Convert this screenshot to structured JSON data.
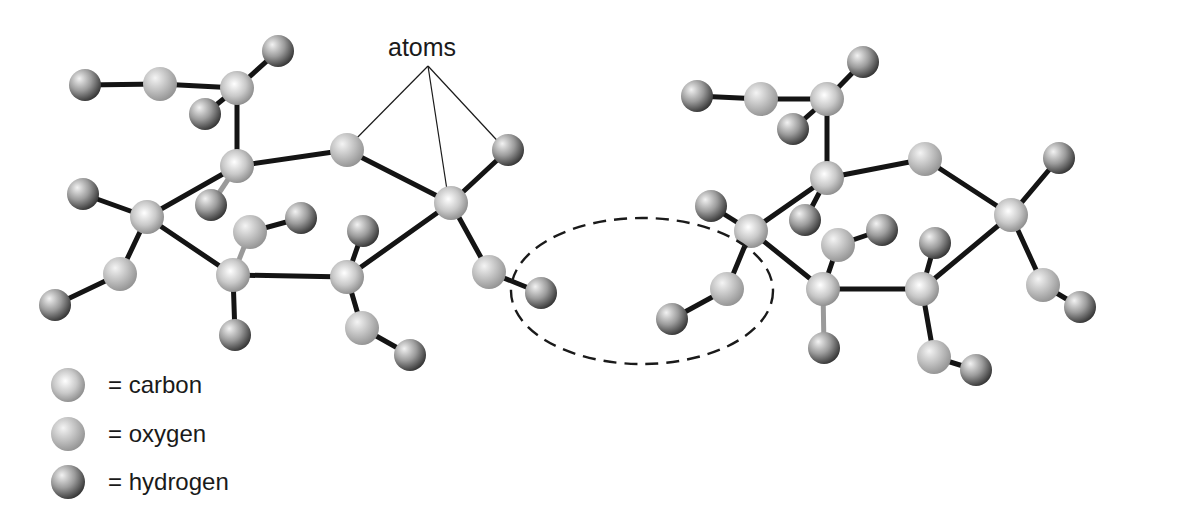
{
  "annotation": {
    "label": "atoms"
  },
  "legend": [
    {
      "key": "carbon",
      "label": "= carbon"
    },
    {
      "key": "oxygen",
      "label": "= oxygen"
    },
    {
      "key": "hydrogen",
      "label": "= hydrogen"
    }
  ],
  "colors": {
    "carbon": {
      "hi": "#ffffff",
      "mid": "#c9c9c9",
      "lo": "#8a8a8a"
    },
    "oxygen": {
      "hi": "#f4f4f4",
      "mid": "#bdbdbd",
      "lo": "#8f8f8f"
    },
    "hydrogen": {
      "hi": "#f2f2f2",
      "mid": "#9c9c9c",
      "lo": "#2e2e2e"
    },
    "bond": "#141414"
  },
  "molecules": [
    {
      "name": "left-sugar",
      "atoms": [
        {
          "id": "a1",
          "type": "hydrogen"
        },
        {
          "id": "a2",
          "type": "oxygen"
        },
        {
          "id": "a3",
          "type": "carbon"
        },
        {
          "id": "a4",
          "type": "hydrogen"
        },
        {
          "id": "a5",
          "type": "hydrogen"
        },
        {
          "id": "a6",
          "type": "carbon"
        },
        {
          "id": "a7",
          "type": "hydrogen"
        },
        {
          "id": "a8",
          "type": "oxygen"
        },
        {
          "id": "a9",
          "type": "carbon"
        },
        {
          "id": "a10",
          "type": "hydrogen"
        },
        {
          "id": "a11",
          "type": "hydrogen"
        },
        {
          "id": "a12",
          "type": "carbon"
        },
        {
          "id": "a13",
          "type": "oxygen"
        },
        {
          "id": "a14",
          "type": "hydrogen"
        },
        {
          "id": "a15",
          "type": "carbon"
        },
        {
          "id": "a16",
          "type": "oxygen"
        },
        {
          "id": "a17",
          "type": "hydrogen"
        },
        {
          "id": "a18",
          "type": "hydrogen"
        },
        {
          "id": "a19",
          "type": "carbon"
        },
        {
          "id": "a20",
          "type": "hydrogen"
        },
        {
          "id": "a21",
          "type": "oxygen"
        },
        {
          "id": "a22",
          "type": "hydrogen"
        },
        {
          "id": "a23",
          "type": "oxygen"
        },
        {
          "id": "a24",
          "type": "hydrogen"
        }
      ]
    },
    {
      "name": "right-sugar",
      "atoms": [
        {
          "id": "b1",
          "type": "hydrogen"
        },
        {
          "id": "b2",
          "type": "oxygen"
        },
        {
          "id": "b3",
          "type": "carbon"
        },
        {
          "id": "b4",
          "type": "hydrogen"
        },
        {
          "id": "b5",
          "type": "hydrogen"
        },
        {
          "id": "b6",
          "type": "carbon"
        },
        {
          "id": "b7",
          "type": "hydrogen"
        },
        {
          "id": "b8",
          "type": "oxygen"
        },
        {
          "id": "b9",
          "type": "carbon"
        },
        {
          "id": "b10",
          "type": "hydrogen"
        },
        {
          "id": "b11",
          "type": "hydrogen"
        },
        {
          "id": "b12",
          "type": "carbon"
        },
        {
          "id": "b13",
          "type": "oxygen"
        },
        {
          "id": "b14",
          "type": "hydrogen"
        },
        {
          "id": "b15",
          "type": "carbon"
        },
        {
          "id": "b16",
          "type": "oxygen"
        },
        {
          "id": "b17",
          "type": "hydrogen"
        },
        {
          "id": "b18",
          "type": "hydrogen"
        },
        {
          "id": "b19",
          "type": "carbon"
        },
        {
          "id": "b20",
          "type": "hydrogen"
        },
        {
          "id": "b21",
          "type": "oxygen"
        },
        {
          "id": "b22",
          "type": "hydrogen"
        },
        {
          "id": "b23",
          "type": "oxygen"
        },
        {
          "id": "b24",
          "type": "hydrogen"
        }
      ]
    }
  ],
  "highlight": {
    "meaning": "water formed between molecules (H from one, OH from other)"
  }
}
